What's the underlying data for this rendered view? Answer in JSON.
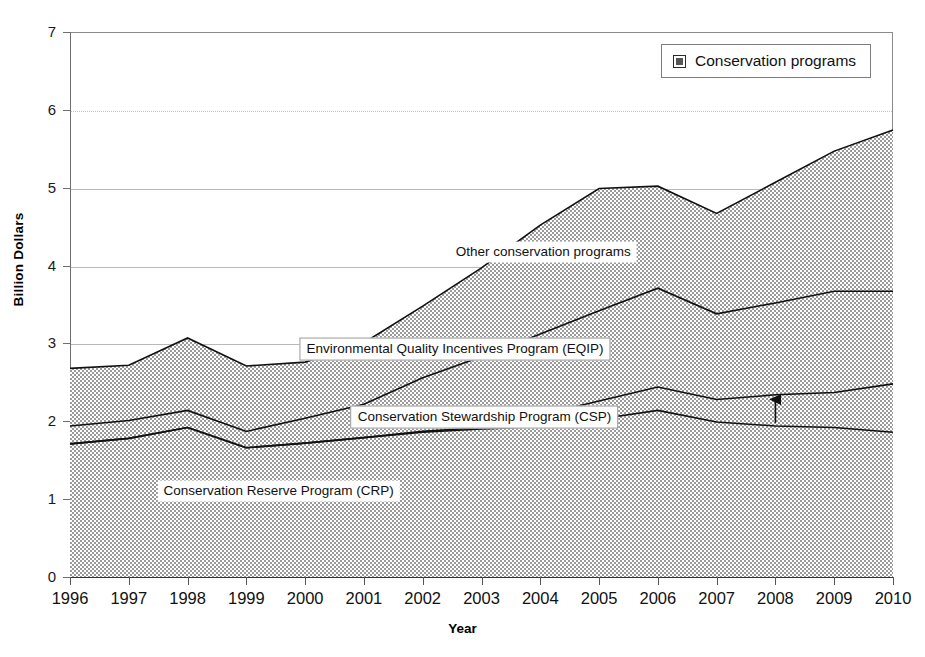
{
  "chart_data": {
    "type": "area",
    "stacked": true,
    "title": "",
    "xlabel": "Year",
    "ylabel": "Billion Dollars",
    "xlim": [
      1996,
      2010
    ],
    "ylim": [
      0,
      7
    ],
    "ytick_step": 1,
    "grid": true,
    "legend_position": "top-right",
    "legend_entries": [
      "Conservation programs"
    ],
    "categories": [
      1996,
      1997,
      1998,
      1999,
      2000,
      2001,
      2002,
      2003,
      2004,
      2005,
      2006,
      2007,
      2008,
      2009,
      2010
    ],
    "xtick_labels": [
      "1996",
      "1997",
      "1998",
      "1999",
      "2000",
      "2001",
      "2002",
      "2003",
      "2004",
      "2005",
      "2006",
      "2007",
      "2008",
      "2009",
      "2010"
    ],
    "ytick_labels": [
      "0",
      "1",
      "2",
      "3",
      "4",
      "5",
      "6",
      "7"
    ],
    "cumulative_series": [
      {
        "name": "Conservation Reserve Program (CRP)",
        "short": "CRP",
        "values": [
          1.71,
          1.78,
          1.92,
          1.66,
          1.72,
          1.79,
          1.86,
          1.9,
          1.93,
          2.03,
          2.14,
          1.99,
          1.94,
          1.92,
          1.86
        ]
      },
      {
        "name": "Conservation Stewardship Program (CSP)",
        "short": "CSP",
        "values": [
          1.71,
          1.78,
          1.92,
          1.66,
          1.72,
          1.79,
          1.87,
          1.92,
          2.08,
          2.26,
          2.44,
          2.28,
          2.34,
          2.37,
          2.48
        ]
      },
      {
        "name": "Environmental Quality Incentives Program (EQIP)",
        "short": "EQIP",
        "values": [
          1.94,
          2.01,
          2.14,
          1.87,
          2.04,
          2.22,
          2.56,
          2.83,
          3.12,
          3.42,
          3.71,
          3.38,
          3.52,
          3.67,
          3.67
        ]
      },
      {
        "name": "Other conservation programs",
        "short": "Other",
        "values": [
          2.68,
          2.72,
          3.07,
          2.71,
          2.76,
          3.01,
          3.48,
          3.97,
          4.52,
          4.99,
          5.02,
          4.67,
          5.07,
          5.47,
          5.74
        ]
      }
    ],
    "annotations": [
      {
        "id": "other-conservation-programs",
        "text": "Other conservation programs",
        "x": 2004.05,
        "y": 4.17,
        "boxed": false
      },
      {
        "id": "eqip",
        "text": "Environmental Quality Incentives Program (EQIP)",
        "x": 2002.55,
        "y": 2.93,
        "boxed": true
      },
      {
        "id": "csp",
        "text": "Conservation Stewardship Program (CSP)",
        "x": 2003.05,
        "y": 2.05,
        "boxed": true
      },
      {
        "id": "crp",
        "text": "Conservation Reserve Program (CRP)",
        "x": 1999.55,
        "y": 1.1,
        "boxed": false
      }
    ],
    "arrow": {
      "id": "csp-pointer",
      "from_x": 2008.0,
      "from_y": 1.98,
      "to_x": 2008.0,
      "to_y": 2.28
    }
  },
  "legend": {
    "items": [
      {
        "label": "Conservation programs",
        "swatch": "hatched-pattern-swatch"
      }
    ]
  },
  "axes": {
    "y_title": "Billion Dollars",
    "x_title": "Year"
  },
  "colors": {
    "fill": "#d9d9d9",
    "line": "#111111",
    "grid": "#b9b9b9",
    "frame": "#8a8a8a",
    "text": "#111111"
  }
}
